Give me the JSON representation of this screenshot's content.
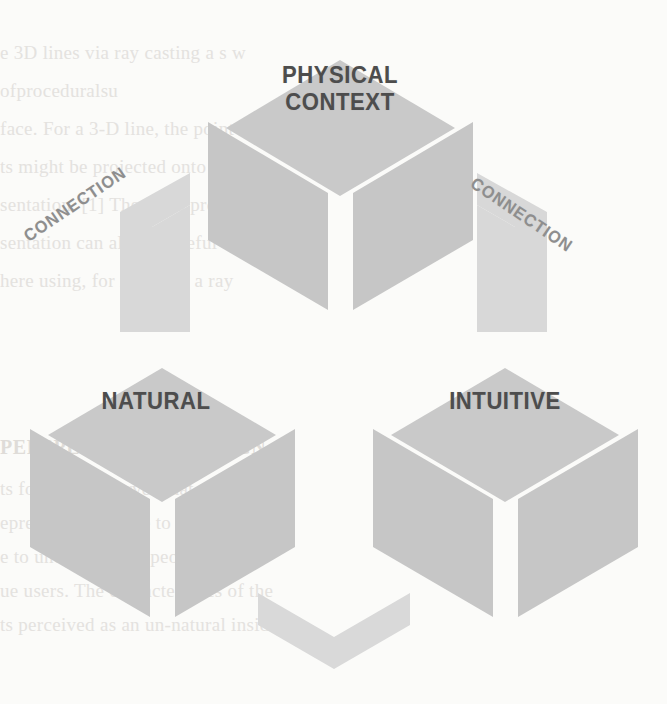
{
  "figure": {
    "type": "venn-triad-isometric-cubes",
    "background_color": "#fbfbf9",
    "cube_face_color": "#c7c7c7",
    "cube_top_face_color": "#c9c9c9",
    "connector_color": "#d8d8d8",
    "label_color": "#4d4d4d",
    "connection_label_color": "#8e8e8e"
  },
  "nodes": [
    {
      "id": "physical-context",
      "label": "PHYSICAL\nCONTEXT",
      "position": "top"
    },
    {
      "id": "natural",
      "label": "NATURAL",
      "position": "bottom-left"
    },
    {
      "id": "intuitive",
      "label": "INTUITIVE",
      "position": "bottom-right"
    }
  ],
  "connectors": [
    {
      "id": "connection-left",
      "label": "CONNECTION",
      "between": "natural ↔ physical-context",
      "rotation_deg": -34
    },
    {
      "id": "connection-right",
      "label": "CONNECTION",
      "between": "physical-context ↔ intuitive",
      "rotation_deg": 34
    },
    {
      "id": "connection-bottom",
      "label": "",
      "between": "natural ↔ intuitive",
      "rotation_deg": 0
    }
  ],
  "background_bleed_text": {
    "lines": [
      "e 3D lines via ray casting a s w",
      "ofproceduralsu",
      "face. For a 3-D line, the point set, for a",
      "ts might be projected onto the",
      "sentation. [1] The fixed  prope",
      "sentation can also be useful for",
      "here using, for instance, a ray"
    ],
    "heading": "PERSPECTIVE OF DESIGN",
    "lower_lines": [
      "ts for us to observe what actually",
      "epresents. We have to keep it simple",
      "e to understand by people and it",
      "ue users. The characteristics of the",
      "ts perceived as an un-natural inside of"
    ]
  }
}
